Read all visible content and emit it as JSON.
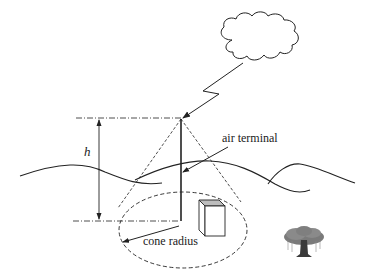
{
  "diagram": {
    "title": "",
    "labels": {
      "height": "h",
      "air_terminal": "air terminal",
      "cone_radius": "cone radius"
    },
    "elements": [
      {
        "name": "cloud",
        "type": "shape"
      },
      {
        "name": "lightning-bolt",
        "type": "arrow"
      },
      {
        "name": "air-terminal-mast",
        "type": "line"
      },
      {
        "name": "height-dimension",
        "type": "arrow",
        "label": "h"
      },
      {
        "name": "protection-cone",
        "type": "dashed-lines"
      },
      {
        "name": "cone-base-ellipse",
        "type": "dashed-ellipse"
      },
      {
        "name": "ground-terrain",
        "type": "curves"
      },
      {
        "name": "building-box",
        "type": "shape"
      },
      {
        "name": "tree",
        "type": "icon"
      }
    ],
    "colors": {
      "line": "#222222",
      "box_top": "#bdbdbd",
      "tree": "#7a7a7a",
      "background": "#ffffff"
    }
  }
}
